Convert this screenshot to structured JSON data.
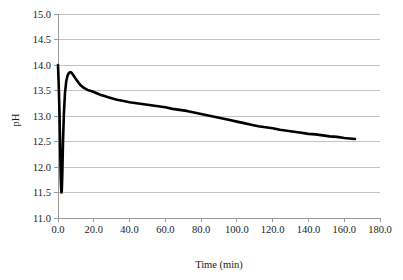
{
  "chart_data": {
    "type": "line",
    "title": "",
    "xlabel": "Time (min)",
    "ylabel": "pH",
    "xlim": [
      0.0,
      180.0
    ],
    "ylim": [
      11.0,
      15.0
    ],
    "xticks": [
      "0.0",
      "20.0",
      "40.0",
      "60.0",
      "80.0",
      "100.0",
      "120.0",
      "140.0",
      "160.0",
      "180.0"
    ],
    "yticks": [
      "11.0",
      "11.5",
      "12.0",
      "12.5",
      "13.0",
      "13.5",
      "14.0",
      "14.5",
      "15.0"
    ],
    "grid": "horizontal",
    "legend": "none",
    "series": [
      {
        "name": "pH",
        "color": "#000000",
        "x": [
          0.0,
          0.4,
          0.8,
          1.1,
          1.3,
          1.5,
          1.7,
          1.9,
          2.1,
          2.4,
          2.8,
          3.3,
          3.9,
          4.6,
          5.4,
          6.2,
          7.0,
          7.8,
          8.6,
          9.5,
          10.5,
          11.5,
          12.5,
          13.5,
          14.5,
          15.5,
          16.5,
          17.5,
          18.5,
          20.0,
          22.0,
          24.0,
          26.0,
          28.0,
          30.0,
          33.0,
          36.0,
          40.0,
          44.0,
          48.0,
          52.0,
          56.0,
          60.0,
          64.0,
          68.0,
          72.0,
          76.0,
          80.0,
          84.0,
          88.0,
          92.0,
          96.0,
          100.0,
          104.0,
          108.0,
          112.0,
          116.0,
          120.0,
          124.0,
          128.0,
          132.0,
          136.0,
          140.0,
          144.0,
          148.0,
          152.0,
          156.0,
          160.0,
          163.0,
          166.0
        ],
        "y": [
          14.0,
          13.62,
          13.1,
          12.6,
          12.2,
          11.85,
          11.62,
          11.5,
          11.52,
          11.85,
          12.5,
          13.05,
          13.45,
          13.68,
          13.8,
          13.85,
          13.86,
          13.84,
          13.8,
          13.75,
          13.7,
          13.65,
          13.61,
          13.58,
          13.55,
          13.53,
          13.51,
          13.5,
          13.49,
          13.47,
          13.44,
          13.41,
          13.39,
          13.37,
          13.35,
          13.32,
          13.3,
          13.27,
          13.25,
          13.23,
          13.21,
          13.19,
          13.17,
          13.14,
          13.12,
          13.1,
          13.07,
          13.04,
          13.01,
          12.98,
          12.95,
          12.92,
          12.89,
          12.86,
          12.83,
          12.8,
          12.78,
          12.76,
          12.73,
          12.71,
          12.69,
          12.67,
          12.65,
          12.64,
          12.62,
          12.6,
          12.59,
          12.57,
          12.56,
          12.55
        ]
      }
    ]
  }
}
